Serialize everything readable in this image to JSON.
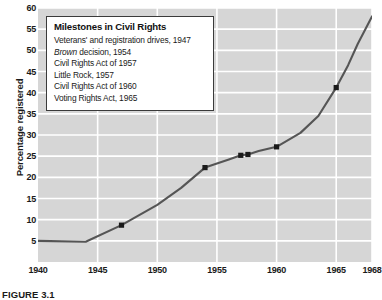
{
  "figure": {
    "caption": "FIGURE 3.1"
  },
  "chart_data": {
    "type": "line",
    "title": "",
    "xlabel": "",
    "ylabel": "Percentage registered",
    "xlim": [
      1940,
      1968
    ],
    "ylim": [
      0,
      60
    ],
    "grid": true,
    "legend_position": "top-left-inset",
    "y_ticks": [
      5,
      10,
      15,
      20,
      25,
      30,
      35,
      40,
      45,
      50,
      55,
      60
    ],
    "x_ticks": [
      1940,
      1945,
      1950,
      1955,
      1960,
      1965,
      1968
    ],
    "x_tick_labels": [
      "1940",
      "1945",
      "1950",
      "1955",
      "1960",
      "1965",
      "1968"
    ],
    "series": [
      {
        "name": "Percentage registered",
        "color": "#555555",
        "x": [
          1940,
          1944,
          1947,
          1950,
          1952,
          1954,
          1956,
          1957,
          1957.6,
          1958.5,
          1960,
          1962,
          1963.5,
          1965,
          1966,
          1966.8,
          1968
        ],
        "values": [
          5,
          4.8,
          8.7,
          13.5,
          17.5,
          22.3,
          24.2,
          25.2,
          25.4,
          26.2,
          27.2,
          30.5,
          34.5,
          41.2,
          46.5,
          51.5,
          58
        ]
      }
    ],
    "markers": [
      {
        "label": "Veterans' and registration drives",
        "year": 1947,
        "value": 8.7
      },
      {
        "label": "Brown decision",
        "year": 1954,
        "value": 22.3
      },
      {
        "label": "Civil Rights Act of 1957",
        "year": 1957,
        "value": 25.2
      },
      {
        "label": "Little Rock",
        "year": 1957.6,
        "value": 25.4
      },
      {
        "label": "Civil Rights Act of 1960",
        "year": 1960,
        "value": 27.2
      },
      {
        "label": "Voting Rights Act",
        "year": 1965,
        "value": 41.2
      }
    ],
    "legend": {
      "title": "Milestones in Civil Rights",
      "items": [
        {
          "text": "Veterans' and registration drives, 1947",
          "italic_prefix": ""
        },
        {
          "text": " decision, 1954",
          "italic_prefix": "Brown"
        },
        {
          "text": "Civil Rights Act of 1957",
          "italic_prefix": ""
        },
        {
          "text": "Little Rock, 1957",
          "italic_prefix": ""
        },
        {
          "text": "Civil Rights Act of 1960",
          "italic_prefix": ""
        },
        {
          "text": "Voting Rights Act, 1965",
          "italic_prefix": ""
        }
      ]
    },
    "colors": {
      "plot_background": "#d6d6d6",
      "gridline": "#ffffff",
      "line": "#555555",
      "marker": "#1a1a1a",
      "text": "#1a1a1a"
    }
  }
}
